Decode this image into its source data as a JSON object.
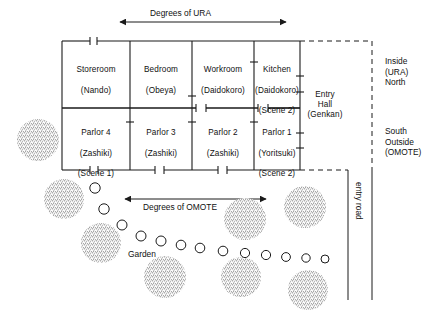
{
  "diagram": {
    "colors": {
      "line": "#1a1a1a",
      "text": "#111111",
      "bush_fill": "#8d8d8d",
      "background": "#ffffff"
    },
    "axes": {
      "ura_arrow_label": "Degrees of URA",
      "omote_arrow_label": "Degrees of OMOTE"
    },
    "rooms": {
      "upper_row": [
        {
          "name": "Storeroom",
          "japanese": "(Nando)",
          "scene": ""
        },
        {
          "name": "Bedroom",
          "japanese": "(Obeya)",
          "scene": ""
        },
        {
          "name": "Workroom",
          "japanese": "(Daidokoro)",
          "scene": ""
        },
        {
          "name": "Kitchen",
          "japanese": "(Daidokoro)",
          "scene": "(Scene 2)"
        }
      ],
      "lower_row": [
        {
          "name": "Parlor 4",
          "japanese": "(Zashiki)",
          "scene": "(Scene 1)"
        },
        {
          "name": "Parlor 3",
          "japanese": "(Zashiki)",
          "scene": ""
        },
        {
          "name": "Parlor 2",
          "japanese": "(Zashiki)",
          "scene": ""
        },
        {
          "name": "Parlor 1",
          "japanese": "(Yoritsuki)",
          "scene": "(Scene 2)"
        }
      ],
      "entry_hall": "Entry\nHall\n(Genkan)"
    },
    "orientation": {
      "north_label": "Inside\n(URA)\nNorth",
      "south_label": "South\nOutside\n(OMOTE)"
    },
    "garden": {
      "label": "Garden",
      "entry_road_label": "entry road"
    }
  },
  "chart_data": {
    "type": "diagram",
    "plan_geometry": {
      "outer_rect": {
        "x": 62,
        "y": 41,
        "w": 238,
        "h": 129
      },
      "mid_wall_y": 108,
      "column_x": [
        62,
        130,
        192,
        254,
        300
      ],
      "entry_hall_rect": {
        "x": 300,
        "y": 41,
        "w": 70,
        "h": 129
      }
    },
    "ura_arrow": {
      "x1": 118,
      "y": 22,
      "x2": 288
    },
    "omote_arrow": {
      "x1": 123,
      "y": 199,
      "x2": 268
    },
    "stepping_stones": [
      {
        "cx": 95,
        "cy": 188,
        "r": 5.2
      },
      {
        "cx": 104,
        "cy": 209,
        "r": 5.2
      },
      {
        "cx": 122,
        "cy": 225,
        "r": 5.0
      },
      {
        "cx": 141,
        "cy": 236,
        "r": 5.0
      },
      {
        "cx": 161,
        "cy": 241,
        "r": 5.0
      },
      {
        "cx": 181,
        "cy": 245,
        "r": 4.8
      },
      {
        "cx": 200,
        "cy": 248,
        "r": 4.8
      },
      {
        "cx": 223,
        "cy": 251,
        "r": 4.8
      },
      {
        "cx": 245,
        "cy": 253,
        "r": 4.6
      },
      {
        "cx": 266,
        "cy": 255,
        "r": 4.6
      },
      {
        "cx": 286,
        "cy": 257,
        "r": 4.4
      },
      {
        "cx": 306,
        "cy": 258,
        "r": 4.2
      },
      {
        "cx": 325,
        "cy": 259,
        "r": 4.0
      }
    ],
    "shrubs": [
      {
        "cx": 38,
        "cy": 140,
        "r": 21
      },
      {
        "cx": 64,
        "cy": 199,
        "r": 20
      },
      {
        "cx": 101,
        "cy": 243,
        "r": 20
      },
      {
        "cx": 165,
        "cy": 277,
        "r": 21
      },
      {
        "cx": 245,
        "cy": 219,
        "r": 21
      },
      {
        "cx": 241,
        "cy": 277,
        "r": 20
      },
      {
        "cx": 305,
        "cy": 207,
        "r": 21
      },
      {
        "cx": 308,
        "cy": 290,
        "r": 20
      }
    ],
    "entry_road": {
      "x1": 348,
      "x2": 372,
      "y1": 172,
      "y2": 300
    }
  }
}
